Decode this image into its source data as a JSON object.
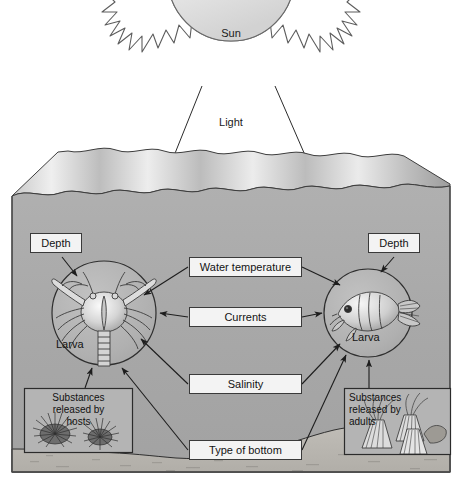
{
  "diagram": {
    "title_text": "Sun",
    "light_text": "Light"
  },
  "sky": {
    "sun_label": "Sun",
    "light_label": "Light"
  },
  "larvae": {
    "left": {
      "label": "Larva",
      "kind": "crab-larva",
      "depth_label": "Depth"
    },
    "right": {
      "label": "Larva",
      "kind": "fish-larva",
      "depth_label": "Depth"
    }
  },
  "factors": [
    {
      "label": "Water temperature"
    },
    {
      "label": "Currents"
    },
    {
      "label": "Salinity"
    },
    {
      "label": "Type of bottom"
    }
  ],
  "panels": {
    "left": {
      "line1": "Substances",
      "line2": "released by",
      "line3": "hosts",
      "subject": "sea-urchins"
    },
    "right": {
      "line1": "Substances",
      "line2": "released by",
      "line3": "adults",
      "subject": "barnacles"
    }
  },
  "colors": {
    "water": "#a9a9a9",
    "water_surface_light": "#d9d9d9",
    "water_surface_dark": "#8f8f8f",
    "seafloor": "#b9b6b0",
    "box_fill": "#f3f3f3",
    "outline": "#3a3a3a",
    "sun_fill": "#e9e9e9",
    "frame": "#555555",
    "text": "#141414"
  }
}
